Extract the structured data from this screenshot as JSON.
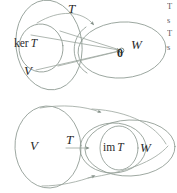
{
  "figure": {
    "caption_alt": "Kernel and image of a linear transformation T from V to W",
    "stroke_color": "#8e9a92",
    "text_color": "#2b2b2b",
    "background_color": "#ffffff"
  },
  "top_diagram": {
    "name": "kernel-diagram",
    "map_label": "T",
    "kernel_label_op": "ker",
    "kernel_label_var": "T",
    "domain_label": "V",
    "codomain_label": "W",
    "zero_label": "0"
  },
  "bottom_diagram": {
    "name": "image-diagram",
    "map_label": "T",
    "domain_label": "V",
    "codomain_label": "W",
    "image_label_op": "im",
    "image_label_var": "T"
  },
  "margin_text": {
    "line1": "T",
    "line2": "s",
    "line3": "T",
    "line4": "s"
  }
}
